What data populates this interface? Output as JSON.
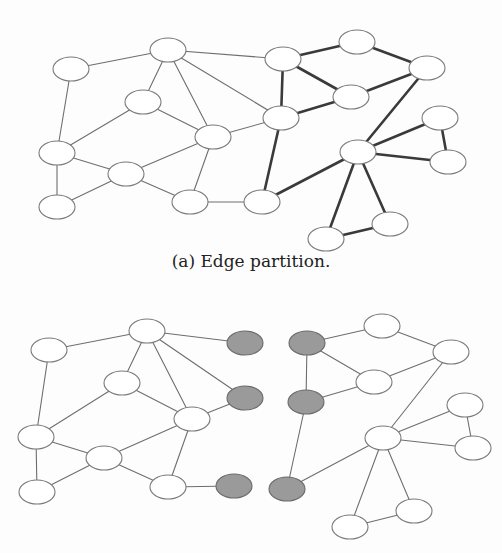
{
  "figure": {
    "subfigures": [
      {
        "id": "a",
        "caption": "(a) Edge partition.",
        "caption_y": 261,
        "nodes": [
          {
            "id": "A",
            "x": 71,
            "y": 69,
            "fill": "white"
          },
          {
            "id": "B",
            "x": 168,
            "y": 50,
            "fill": "white"
          },
          {
            "id": "C",
            "x": 143,
            "y": 102,
            "fill": "white"
          },
          {
            "id": "D",
            "x": 213,
            "y": 137,
            "fill": "white"
          },
          {
            "id": "E",
            "x": 57,
            "y": 153,
            "fill": "white"
          },
          {
            "id": "F",
            "x": 126,
            "y": 174,
            "fill": "white"
          },
          {
            "id": "G",
            "x": 57,
            "y": 207,
            "fill": "white"
          },
          {
            "id": "H",
            "x": 190,
            "y": 202,
            "fill": "white"
          },
          {
            "id": "I",
            "x": 283,
            "y": 59,
            "fill": "white"
          },
          {
            "id": "J",
            "x": 357,
            "y": 42,
            "fill": "white"
          },
          {
            "id": "K",
            "x": 427,
            "y": 68,
            "fill": "white"
          },
          {
            "id": "L",
            "x": 351,
            "y": 97,
            "fill": "white"
          },
          {
            "id": "M",
            "x": 281,
            "y": 118,
            "fill": "white"
          },
          {
            "id": "N",
            "x": 440,
            "y": 118,
            "fill": "white"
          },
          {
            "id": "O",
            "x": 358,
            "y": 152,
            "fill": "white"
          },
          {
            "id": "P",
            "x": 448,
            "y": 162,
            "fill": "white"
          },
          {
            "id": "Q",
            "x": 262,
            "y": 202,
            "fill": "white"
          },
          {
            "id": "R",
            "x": 390,
            "y": 224,
            "fill": "white"
          },
          {
            "id": "S",
            "x": 326,
            "y": 239,
            "fill": "white"
          }
        ],
        "edges": [
          [
            "A",
            "B",
            "thin"
          ],
          [
            "A",
            "E",
            "thin"
          ],
          [
            "B",
            "C",
            "thin"
          ],
          [
            "B",
            "D",
            "thin"
          ],
          [
            "C",
            "E",
            "thin"
          ],
          [
            "C",
            "D",
            "thin"
          ],
          [
            "E",
            "F",
            "thin"
          ],
          [
            "E",
            "G",
            "thin"
          ],
          [
            "G",
            "F",
            "thin"
          ],
          [
            "F",
            "D",
            "thin"
          ],
          [
            "F",
            "H",
            "thin"
          ],
          [
            "D",
            "H",
            "thin"
          ],
          [
            "D",
            "M",
            "thin"
          ],
          [
            "B",
            "I",
            "thin"
          ],
          [
            "B",
            "M",
            "thin"
          ],
          [
            "H",
            "Q",
            "thin"
          ],
          [
            "I",
            "J",
            "thick"
          ],
          [
            "J",
            "K",
            "thick"
          ],
          [
            "I",
            "L",
            "thick"
          ],
          [
            "L",
            "K",
            "thick"
          ],
          [
            "I",
            "M",
            "thick"
          ],
          [
            "M",
            "L",
            "thick"
          ],
          [
            "M",
            "Q",
            "thick"
          ],
          [
            "Q",
            "O",
            "thick"
          ],
          [
            "O",
            "K",
            "thick"
          ],
          [
            "O",
            "N",
            "thick"
          ],
          [
            "O",
            "P",
            "thick"
          ],
          [
            "N",
            "P",
            "thick"
          ],
          [
            "O",
            "S",
            "thick"
          ],
          [
            "O",
            "R",
            "thick"
          ],
          [
            "S",
            "R",
            "thick"
          ]
        ]
      },
      {
        "id": "b",
        "caption": "",
        "nodes": [
          {
            "id": "A2",
            "x": 49,
            "y": 350,
            "fill": "white"
          },
          {
            "id": "B2",
            "x": 147,
            "y": 331,
            "fill": "white"
          },
          {
            "id": "C2",
            "x": 122,
            "y": 383,
            "fill": "white"
          },
          {
            "id": "D2",
            "x": 192,
            "y": 419,
            "fill": "white"
          },
          {
            "id": "E2",
            "x": 36,
            "y": 437,
            "fill": "white"
          },
          {
            "id": "F2",
            "x": 104,
            "y": 458,
            "fill": "white"
          },
          {
            "id": "G2",
            "x": 37,
            "y": 492,
            "fill": "white"
          },
          {
            "id": "H2",
            "x": 168,
            "y": 487,
            "fill": "white"
          },
          {
            "id": "g1",
            "x": 245,
            "y": 343,
            "fill": "gray"
          },
          {
            "id": "g2",
            "x": 245,
            "y": 398,
            "fill": "gray"
          },
          {
            "id": "g3",
            "x": 234,
            "y": 486,
            "fill": "gray"
          },
          {
            "id": "g4",
            "x": 307,
            "y": 343,
            "fill": "gray"
          },
          {
            "id": "g5",
            "x": 306,
            "y": 402,
            "fill": "gray"
          },
          {
            "id": "g6",
            "x": 287,
            "y": 489,
            "fill": "gray"
          },
          {
            "id": "I2",
            "x": 382,
            "y": 326,
            "fill": "white"
          },
          {
            "id": "K2",
            "x": 451,
            "y": 352,
            "fill": "white"
          },
          {
            "id": "L2",
            "x": 374,
            "y": 382,
            "fill": "white"
          },
          {
            "id": "N2",
            "x": 465,
            "y": 405,
            "fill": "white"
          },
          {
            "id": "O2",
            "x": 383,
            "y": 438,
            "fill": "white"
          },
          {
            "id": "P2",
            "x": 473,
            "y": 448,
            "fill": "white"
          },
          {
            "id": "R2",
            "x": 414,
            "y": 511,
            "fill": "white"
          },
          {
            "id": "S2",
            "x": 350,
            "y": 527,
            "fill": "white"
          }
        ],
        "edges": [
          [
            "A2",
            "B2",
            "thin"
          ],
          [
            "A2",
            "E2",
            "thin"
          ],
          [
            "B2",
            "C2",
            "thin"
          ],
          [
            "B2",
            "D2",
            "thin"
          ],
          [
            "B2",
            "g1",
            "thin"
          ],
          [
            "B2",
            "g2",
            "thin"
          ],
          [
            "C2",
            "E2",
            "thin"
          ],
          [
            "C2",
            "D2",
            "thin"
          ],
          [
            "D2",
            "g2",
            "thin"
          ],
          [
            "E2",
            "F2",
            "thin"
          ],
          [
            "E2",
            "G2",
            "thin"
          ],
          [
            "G2",
            "F2",
            "thin"
          ],
          [
            "F2",
            "D2",
            "thin"
          ],
          [
            "F2",
            "H2",
            "thin"
          ],
          [
            "D2",
            "H2",
            "thin"
          ],
          [
            "H2",
            "g3",
            "thin"
          ],
          [
            "g4",
            "g5",
            "thin"
          ],
          [
            "g4",
            "I2",
            "thin"
          ],
          [
            "g4",
            "L2",
            "thin"
          ],
          [
            "g5",
            "L2",
            "thin"
          ],
          [
            "g5",
            "g6",
            "thin"
          ],
          [
            "g6",
            "O2",
            "thin"
          ],
          [
            "I2",
            "K2",
            "thin"
          ],
          [
            "L2",
            "K2",
            "thin"
          ],
          [
            "K2",
            "O2",
            "thin"
          ],
          [
            "O2",
            "N2",
            "thin"
          ],
          [
            "O2",
            "P2",
            "thin"
          ],
          [
            "N2",
            "P2",
            "thin"
          ],
          [
            "O2",
            "S2",
            "thin"
          ],
          [
            "O2",
            "R2",
            "thin"
          ],
          [
            "S2",
            "R2",
            "thin"
          ]
        ]
      }
    ],
    "node_rx": 18,
    "node_ry": 12,
    "colors": {
      "background": "#fdfdfd",
      "node_fill_white": "#ffffff",
      "node_fill_gray": "#9a9a9a",
      "node_stroke": "#7a7a7a",
      "node_stroke_gray": "#6a6a6a",
      "edge_thin": "#6e6e6e",
      "edge_thick": "#3a3a3a"
    }
  }
}
